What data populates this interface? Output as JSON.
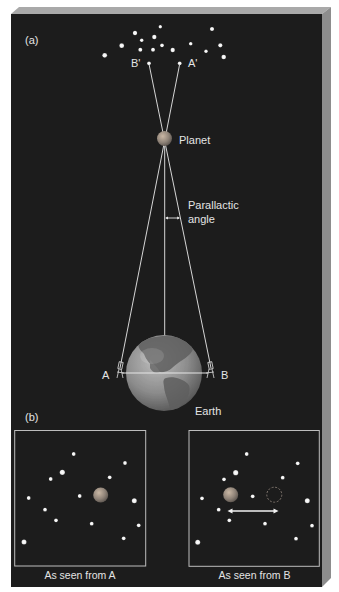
{
  "figure": {
    "colors": {
      "background": "#1c1c1c",
      "bevel_top": "#a8a8a8",
      "bevel_side": "#8e8e8e",
      "star": "#f4f4f4",
      "line": "#d8d8d8",
      "planet": "#8f8a84",
      "earth": "#8a8a8a",
      "frame": "#bdbdbd"
    },
    "panel_a": {
      "label": "(a)",
      "star_b_label": "B'",
      "star_a_label": "A'",
      "planet_label": "Planet",
      "angle_label_line1": "Parallactic",
      "angle_label_line2": "angle",
      "observer_a_label": "A",
      "observer_b_label": "B",
      "earth_label": "Earth"
    },
    "panel_b": {
      "label": "(b)",
      "view_a_caption": "As seen from A",
      "view_b_caption": "As seen from B"
    }
  }
}
